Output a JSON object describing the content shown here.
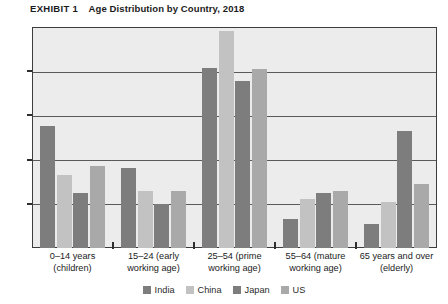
{
  "exhibit": {
    "label": "EXHIBIT 1",
    "title": "Age Distribution by Country, 2018"
  },
  "chart_data": {
    "type": "bar",
    "title": "Age Distribution by Country, 2018",
    "xlabel": "",
    "ylabel": "",
    "ylim": [
      0,
      0.5
    ],
    "ytick_labels": [
      "0",
      "0.1",
      "0.2",
      "0.3",
      "0.4",
      "0.5"
    ],
    "ytick_values": [
      0,
      0.1,
      0.2,
      0.3,
      0.4,
      0.5
    ],
    "grid": true,
    "legend_position": "bottom",
    "categories": [
      "0–14 years (children)",
      "15–24 (early working age)",
      "25–54 (prime working age)",
      "55–64 (mature working age)",
      "65 years and over (elderly)"
    ],
    "category_lines": [
      [
        "0–14 years",
        "(children)"
      ],
      [
        "15–24 (early",
        "working age)"
      ],
      [
        "25–54 (prime",
        "working age)"
      ],
      [
        "55–64 (mature",
        "working age)"
      ],
      [
        "65 years and over",
        "(elderly)"
      ]
    ],
    "series": [
      {
        "name": "India",
        "color": "#7d7d7d",
        "values": [
          0.275,
          0.18,
          0.408,
          0.065,
          0.055
        ]
      },
      {
        "name": "China",
        "color": "#c2c2c2",
        "values": [
          0.165,
          0.13,
          0.49,
          0.11,
          0.105
        ]
      },
      {
        "name": "Japan",
        "color": "#7d7d7d",
        "values": [
          0.125,
          0.1,
          0.378,
          0.125,
          0.265
        ]
      },
      {
        "name": "US",
        "color": "#a9a9a9",
        "values": [
          0.185,
          0.13,
          0.405,
          0.128,
          0.145
        ]
      }
    ]
  },
  "legend": {
    "items": [
      {
        "label": "India",
        "color": "#7d7d7d"
      },
      {
        "label": "China",
        "color": "#c2c2c2"
      },
      {
        "label": "Japan",
        "color": "#7d7d7d"
      },
      {
        "label": "US",
        "color": "#a9a9a9"
      }
    ]
  },
  "colors": {
    "plot_background": "#ececec",
    "plot_border": "#3d3d3d",
    "gridline": "#5a5a5a",
    "text": "#1b1b1b"
  }
}
